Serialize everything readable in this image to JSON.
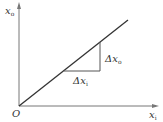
{
  "diagram": {
    "type": "linear-input-output-graph",
    "y_axis": {
      "label": "x",
      "subscript": "o"
    },
    "x_axis": {
      "label": "x",
      "subscript": "i"
    },
    "origin_label": "O",
    "delta_output": {
      "label": "Δx",
      "subscript": "o"
    },
    "delta_input": {
      "label": "Δx",
      "subscript": "i"
    },
    "line_color": "#333333",
    "axis_color": "#666666"
  }
}
